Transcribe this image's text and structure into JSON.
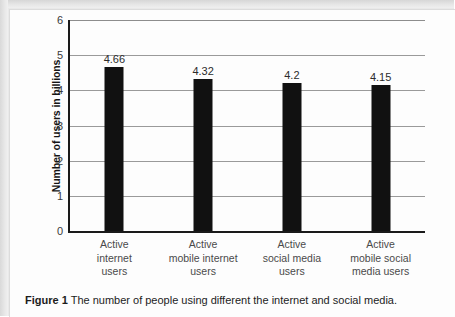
{
  "chart_data": {
    "type": "bar",
    "title": "",
    "xlabel": "",
    "ylabel": "Number of users in billions",
    "ylim": [
      0,
      6
    ],
    "yticks": [
      "0",
      "1",
      "2",
      "3",
      "4",
      "5",
      "6"
    ],
    "grid": true,
    "legend": false,
    "bar_color": "#111111",
    "categories": [
      "Active internet users",
      "Active mobile internet users",
      "Active social media users",
      "Active mobile social media users"
    ],
    "category_lines": [
      [
        "Active",
        "internet",
        "users"
      ],
      [
        "Active",
        "mobile internet",
        "users"
      ],
      [
        "Active",
        "social media",
        "users"
      ],
      [
        "Active",
        "mobile social",
        "media users"
      ]
    ],
    "values": [
      4.66,
      4.32,
      4.2,
      4.15
    ],
    "value_labels": [
      "4.66",
      "4.32",
      "4.2",
      "4.15"
    ]
  },
  "caption": {
    "label": "Figure 1",
    "text": "The number of people using different the internet and social media."
  }
}
